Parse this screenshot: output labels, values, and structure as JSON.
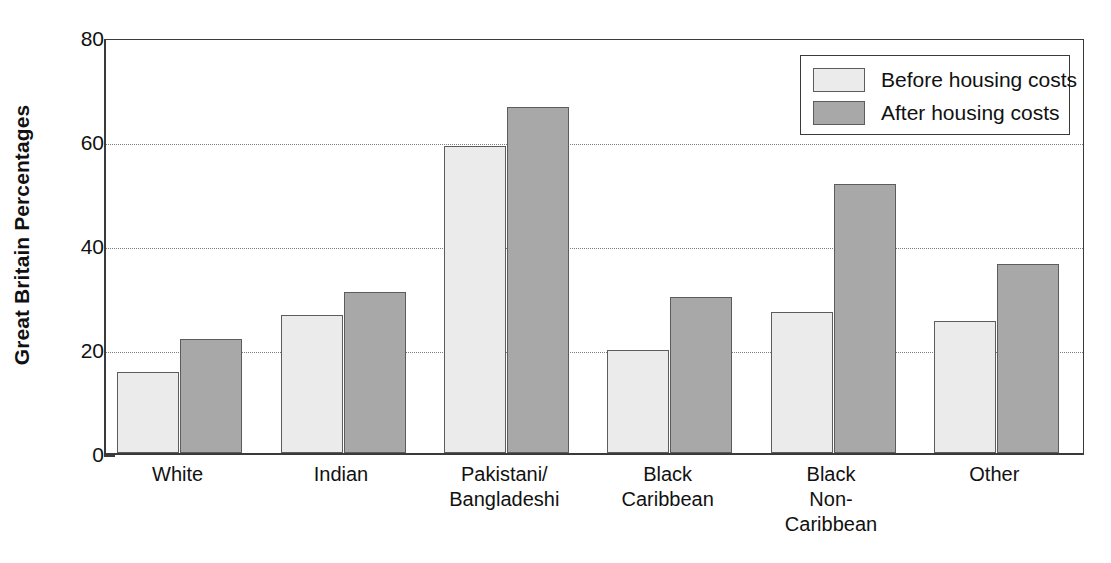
{
  "chart_data": {
    "type": "bar",
    "title": "",
    "xlabel": "",
    "ylabel": "Great Britain Percentages",
    "ylim": [
      0,
      80
    ],
    "yticks": [
      0,
      20,
      40,
      60,
      80
    ],
    "ytick_labels": [
      "0",
      "20",
      "40",
      "60",
      "80"
    ],
    "grid": "horizontal-dotted",
    "legend_position": "top-right",
    "categories": [
      "White",
      "Indian",
      "Pakistani/\nBangladeshi",
      "Black\nCaribbean",
      "Black\nNon-\nCaribbean",
      "Other"
    ],
    "series": [
      {
        "name": "Before housing costs",
        "color": "#ebebeb",
        "values": [
          15.5,
          26.5,
          59.0,
          19.8,
          27.2,
          25.3
        ]
      },
      {
        "name": "After housing costs",
        "color": "#a8a8a8",
        "values": [
          22.0,
          31.0,
          66.5,
          30.0,
          51.7,
          36.4
        ]
      }
    ]
  },
  "legend": {
    "items": [
      {
        "label": "Before housing costs",
        "swatch": "before"
      },
      {
        "label": "After housing costs",
        "swatch": "after"
      }
    ]
  },
  "colors": {
    "before_fill": "#ebebeb",
    "after_fill": "#a8a8a8",
    "bar_stroke": "#5c5c5c",
    "axis": "#3a3a3a",
    "gridline": "#7d7d7d",
    "text": "#111111",
    "background": "#ffffff"
  }
}
